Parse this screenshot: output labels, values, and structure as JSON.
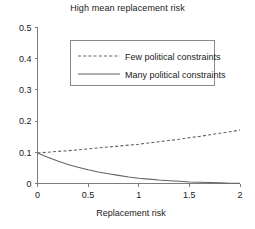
{
  "chart_data": {
    "type": "line",
    "title": "High mean replacement risk",
    "xlabel": "Replacement risk",
    "ylabel": "",
    "xlim": [
      0,
      2
    ],
    "ylim": [
      0,
      0.5
    ],
    "xticks": [
      "0",
      "0.5",
      "1",
      "1.5",
      "2"
    ],
    "xtick_values": [
      0,
      0.5,
      1,
      1.5,
      2
    ],
    "yticks": [
      "0",
      "0.1",
      "0.2",
      "0.3",
      "0.4",
      "0.5"
    ],
    "ytick_values": [
      0,
      0.1,
      0.2,
      0.3,
      0.4,
      0.5
    ],
    "grid": false,
    "legend_position": "upper center",
    "series": [
      {
        "name": "Few political constraints",
        "style": "dashed",
        "color": "#636363",
        "x": [
          0,
          0.1,
          0.2,
          0.3,
          0.4,
          0.5,
          0.6,
          0.7,
          0.8,
          0.9,
          1.0,
          1.1,
          1.2,
          1.3,
          1.4,
          1.5,
          1.6,
          1.7,
          1.8,
          1.9,
          2.0
        ],
        "values": [
          0.098,
          0.1,
          0.103,
          0.105,
          0.108,
          0.111,
          0.114,
          0.117,
          0.12,
          0.123,
          0.126,
          0.13,
          0.134,
          0.138,
          0.142,
          0.147,
          0.151,
          0.156,
          0.161,
          0.166,
          0.171
        ]
      },
      {
        "name": "Many political constraints",
        "style": "solid",
        "color": "#636363",
        "x": [
          0,
          0.1,
          0.2,
          0.3,
          0.4,
          0.5,
          0.6,
          0.7,
          0.8,
          0.9,
          1.0,
          1.1,
          1.2,
          1.3,
          1.4,
          1.5,
          1.6,
          1.7,
          1.8,
          1.9,
          2.0
        ],
        "values": [
          0.098,
          0.084,
          0.072,
          0.061,
          0.052,
          0.044,
          0.037,
          0.031,
          0.026,
          0.021,
          0.017,
          0.014,
          0.011,
          0.009,
          0.007,
          0.005,
          0.004,
          0.003,
          0.002,
          0.001,
          0.001
        ]
      }
    ]
  },
  "legend": {
    "entries": [
      {
        "label": "Few political constraints"
      },
      {
        "label": "Many political constraints"
      }
    ]
  }
}
